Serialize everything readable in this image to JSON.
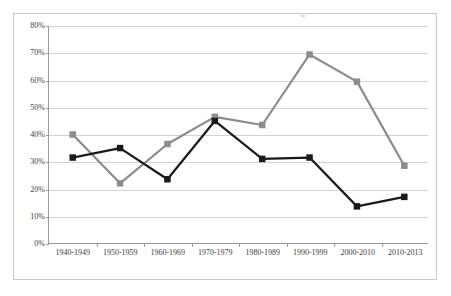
{
  "chart_data": {
    "type": "line",
    "title": "",
    "subtitle": "",
    "xlabel": "",
    "ylabel": "",
    "categories": [
      "1940-1949",
      "1950-1959",
      "1960-1969",
      "1970-1979",
      "1980-1989",
      "1990-1999",
      "2000-2010",
      "2010-2013"
    ],
    "ylim": [
      0,
      80
    ],
    "ytick_labels": [
      "0%",
      "10%",
      "20%",
      "30%",
      "40%",
      "50%",
      "60%",
      "70%",
      "80%"
    ],
    "ytick_values": [
      0,
      10,
      20,
      30,
      40,
      50,
      60,
      70,
      80
    ],
    "grid": true,
    "legend": "none",
    "series": [
      {
        "name": "gray-series",
        "color": "#8c8c8c",
        "marker": "square",
        "values": [
          40,
          22,
          36.5,
          46.5,
          43.5,
          69.5,
          59.5,
          28.5
        ]
      },
      {
        "name": "black-series",
        "color": "#1a1a1a",
        "marker": "square",
        "values": [
          31.5,
          35,
          23.5,
          45,
          31,
          31.5,
          13.5,
          17
        ]
      }
    ]
  },
  "colors": {
    "frame_border": "#c9c9c9",
    "axis_line": "#9a9a9a",
    "gridline": "#d2d2d2",
    "tick_text": "#3d3d3d",
    "plot_background": "#ffffff",
    "series_gray": "#8c8c8c",
    "series_black": "#1a1a1a"
  }
}
